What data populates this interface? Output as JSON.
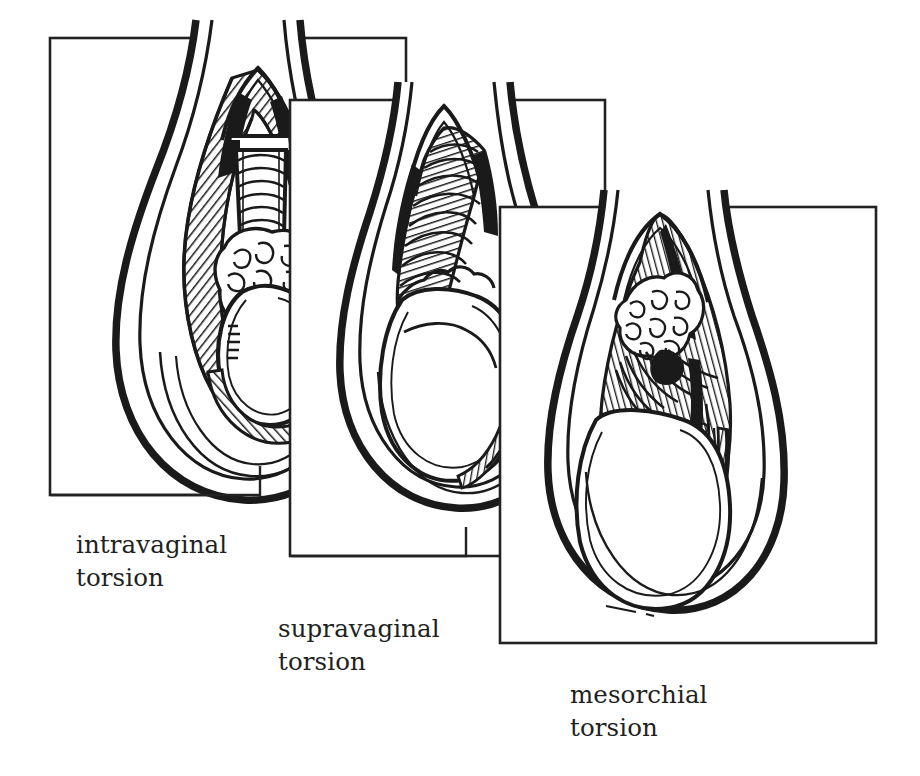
{
  "figure": {
    "style": "line-art medical illustration, black ink on white",
    "background_color": "#ffffff",
    "ink_color": "#1a1a1a",
    "frame_color": "#222222",
    "panel_count": 3
  },
  "panels": [
    {
      "id": "intravaginal",
      "label": "intravaginal\ntorsion",
      "label_line1": "intravaginal",
      "label_line2": "torsion",
      "frame": {
        "x": 50,
        "y": 38,
        "width": 356,
        "height": 457
      },
      "leader": {
        "corner_x": 260,
        "corner_y": 495,
        "stem_top_y": 466
      },
      "description": "Scrotal sac shown in sagittal section. The twisted spermatic cord lies inside the tunica vaginalis; the cross-hatched parietal tunica vaginalis encircles the testis, which hangs free within the cavity."
    },
    {
      "id": "supravaginal",
      "label": "supravaginal\ntorsion",
      "label_line1": "supravaginal",
      "label_line2": "torsion",
      "frame": {
        "x": 290,
        "y": 100,
        "width": 315,
        "height": 456
      },
      "leader": {
        "corner_x": 466,
        "corner_y": 556,
        "stem_top_y": 527
      },
      "description": "Torsion occurs above the attachment of the tunica vaginalis; the whole tunica and testis rotate together, so the testis fills the sac and the hatched layer is restricted to the upper pole."
    },
    {
      "id": "mesorchial",
      "label": "mesorchial\ntorsion",
      "label_line1": "mesorchial",
      "label_line2": "torsion",
      "frame": {
        "x": 500,
        "y": 207,
        "width": 376,
        "height": 436
      },
      "leader": null,
      "description": "Torsion through the mesorchium between epididymis and testis; the epididymis and hatched mesorchium are twisted along the posterior aspect while the testis lies below."
    }
  ],
  "labels": {
    "font_size_px": 24.5,
    "color": "#221f1f"
  }
}
